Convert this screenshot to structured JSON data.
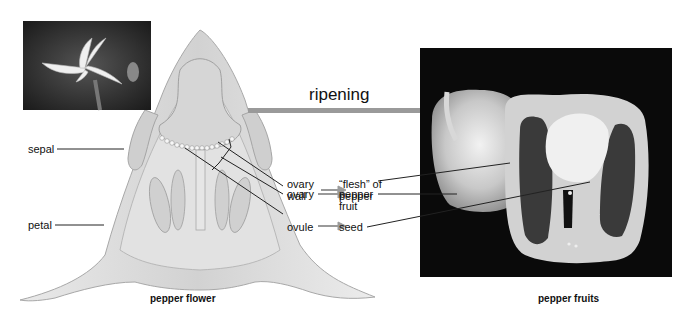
{
  "title": "ripening",
  "left_panel": {
    "caption": "pepper flower",
    "photo": "pepper-flower-photo",
    "labels": {
      "sepal": "sepal",
      "petal": "petal"
    }
  },
  "right_panel": {
    "caption": "pepper fruits",
    "photo": "pepper-fruits-photo"
  },
  "mapping": [
    {
      "flower_part": [
        "ovary",
        "wall"
      ],
      "fruit_part": [
        "“flesh” of",
        "pepper"
      ]
    },
    {
      "flower_part": [
        "ovary"
      ],
      "fruit_part": [
        "pepper",
        "fruit"
      ]
    },
    {
      "flower_part": [
        "ovule"
      ],
      "fruit_part": [
        "seed"
      ]
    }
  ],
  "colors": {
    "arrow": "#9a9a9a",
    "line": "#222222",
    "flower_fill": "#dcdcdc",
    "flower_edge": "#b0b0b0",
    "photo_bg": "#0a0a0a"
  }
}
